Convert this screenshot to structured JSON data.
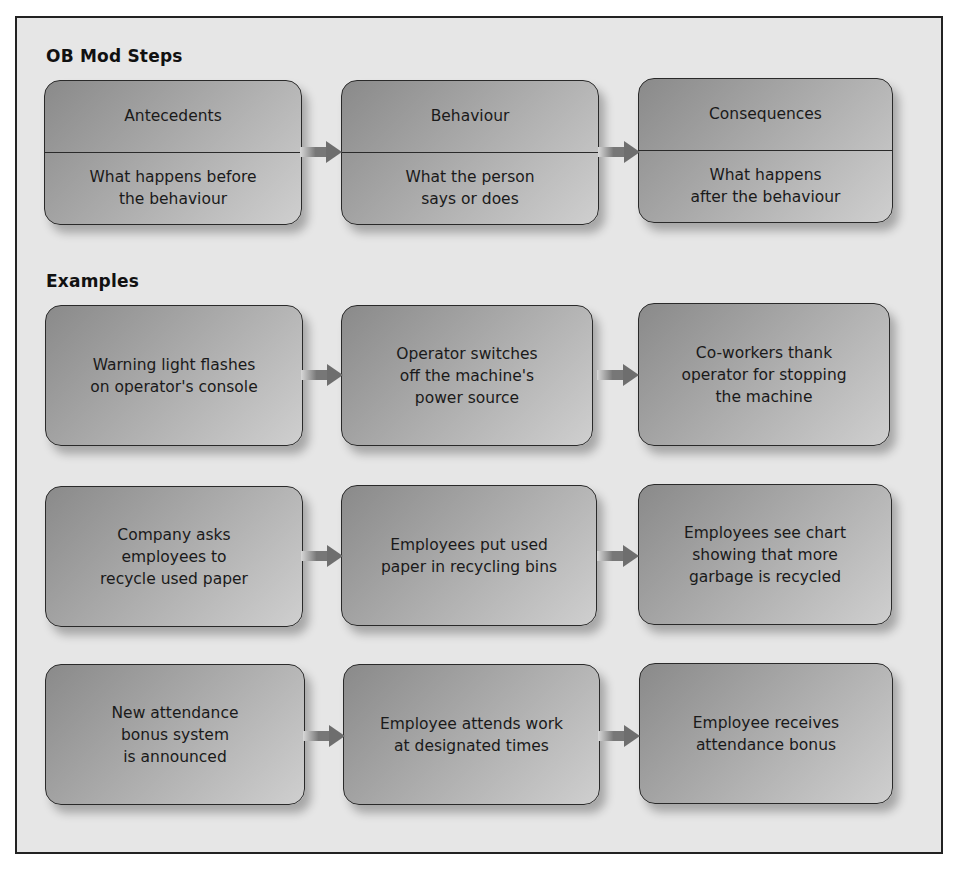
{
  "diagram": {
    "steps_title": "OB Mod Steps",
    "examples_title": "Examples",
    "steps": [
      {
        "heading": "Antecedents",
        "description": "What happens before\nthe behaviour"
      },
      {
        "heading": "Behaviour",
        "description": "What the person\nsays or does"
      },
      {
        "heading": "Consequences",
        "description": "What happens\nafter the behaviour"
      }
    ],
    "examples": [
      {
        "antecedent": "Warning light flashes\non operator's console",
        "behaviour": "Operator switches\noff the machine's\npower source",
        "consequence": "Co-workers thank\noperator for stopping\nthe machine"
      },
      {
        "antecedent": "Company asks\nemployees to\nrecycle used paper",
        "behaviour": "Employees put used\npaper in recycling bins",
        "consequence": "Employees see chart\nshowing that more\ngarbage is recycled"
      },
      {
        "antecedent": "New attendance\nbonus system\nis announced",
        "behaviour": "Employee attends work\nat designated times",
        "consequence": "Employee receives\nattendance bonus"
      }
    ],
    "colors": {
      "frame_bg": "#e6e6e6",
      "box_dark": "#8a8a8a",
      "box_light": "#cfcfcf",
      "border": "#2a2a2a",
      "arrow": "#777777"
    }
  }
}
